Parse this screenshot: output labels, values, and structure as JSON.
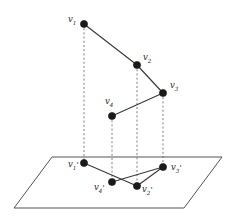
{
  "figure": {
    "type": "geometry-projection-diagram",
    "background_color": "#ffffff",
    "edge_color": "#3a3a3a",
    "projection_line_color": "#6f6f6f",
    "plane_color": "#4a4a4a",
    "vertex_color": "#1a1a1a",
    "vertex_radius": 3.6
  },
  "plane": {
    "name": "projection-plane",
    "corners": [
      {
        "x": 52.0,
        "y": 157.0
      },
      {
        "x": 222.0,
        "y": 157.0
      },
      {
        "x": 184.0,
        "y": 208.0
      },
      {
        "x": 14.0,
        "y": 208.0
      }
    ]
  },
  "space_vertices": [
    {
      "id": "v1",
      "label": "v",
      "sub": "1",
      "prime": "",
      "x": 84.0,
      "y": 24.0,
      "label_x": 68.0,
      "label_y": 22.0
    },
    {
      "id": "v2",
      "label": "v",
      "sub": "2",
      "prime": "",
      "x": 137.0,
      "y": 65.0,
      "label_x": 143.0,
      "label_y": 60.0
    },
    {
      "id": "v3",
      "label": "v",
      "sub": "3",
      "prime": "",
      "x": 163.0,
      "y": 93.0,
      "label_x": 170.0,
      "label_y": 88.0
    },
    {
      "id": "v4",
      "label": "v",
      "sub": "4",
      "prime": "",
      "x": 112.0,
      "y": 116.0,
      "label_x": 105.0,
      "label_y": 104.0
    }
  ],
  "projected_vertices": [
    {
      "id": "v1p",
      "label": "v",
      "sub": "1",
      "prime": "'",
      "x": 84.0,
      "y": 163.0,
      "label_x": 68.0,
      "label_y": 167.0
    },
    {
      "id": "v2p",
      "label": "v",
      "sub": "2",
      "prime": "'",
      "x": 137.0,
      "y": 186.0,
      "label_x": 142.0,
      "label_y": 192.0
    },
    {
      "id": "v3p",
      "label": "v",
      "sub": "3",
      "prime": "'",
      "x": 163.0,
      "y": 167.0,
      "label_x": 171.0,
      "label_y": 170.0
    },
    {
      "id": "v4p",
      "label": "v",
      "sub": "4",
      "prime": "'",
      "x": 112.0,
      "y": 182.0,
      "label_x": 94.0,
      "label_y": 190.0
    }
  ],
  "space_polyline": [
    {
      "from": "v1",
      "to": "v2"
    },
    {
      "from": "v2",
      "to": "v3"
    },
    {
      "from": "v3",
      "to": "v4"
    }
  ],
  "projected_polyline": [
    {
      "from": "v1p",
      "to": "v2p"
    },
    {
      "from": "v2p",
      "to": "v3p"
    },
    {
      "from": "v3p",
      "to": "v4p"
    }
  ],
  "projection_rays": [
    {
      "from": "v1",
      "to": "v1p"
    },
    {
      "from": "v2",
      "to": "v2p"
    },
    {
      "from": "v3",
      "to": "v3p"
    },
    {
      "from": "v4",
      "to": "v4p"
    }
  ]
}
